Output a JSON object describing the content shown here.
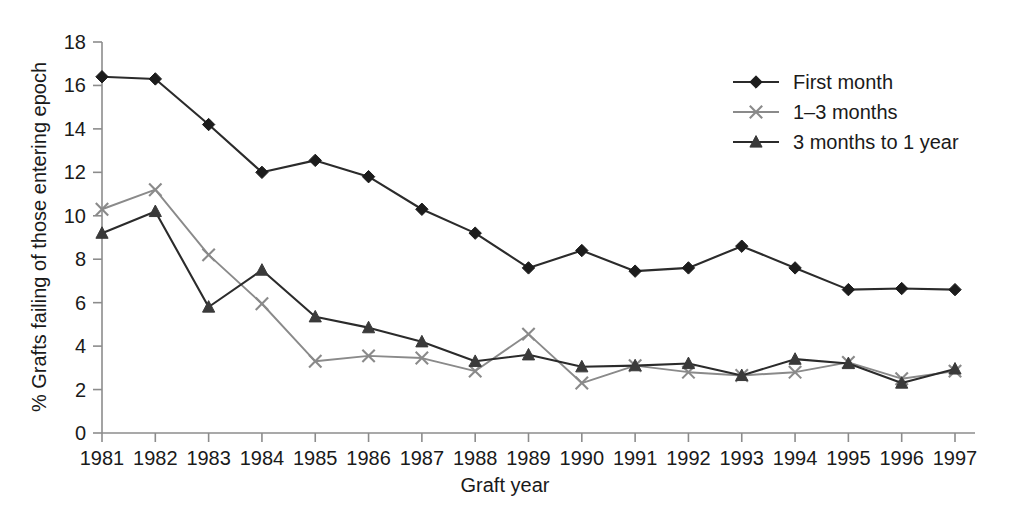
{
  "chart_data": {
    "type": "line",
    "title": "",
    "xlabel": "Graft year",
    "ylabel": "% Grafts failing of those entering epoch",
    "categories": [
      "1981",
      "1982",
      "1983",
      "1984",
      "1985",
      "1986",
      "1987",
      "1988",
      "1989",
      "1990",
      "1991",
      "1992",
      "1993",
      "1994",
      "1995",
      "1996",
      "1997"
    ],
    "x": [
      1981,
      1982,
      1983,
      1984,
      1985,
      1986,
      1987,
      1988,
      1989,
      1990,
      1991,
      1992,
      1993,
      1994,
      1995,
      1996,
      1997
    ],
    "xlim": [
      1981,
      1997
    ],
    "ylim": [
      0,
      18
    ],
    "yticks": [
      0,
      2,
      4,
      6,
      8,
      10,
      12,
      14,
      16,
      18
    ],
    "ytick_labels": [
      "0",
      "2",
      "4",
      "6",
      "8",
      "10",
      "12",
      "14",
      "16",
      "18"
    ],
    "grid": false,
    "legend_position": "top-right",
    "series": [
      {
        "name": "First month",
        "marker": "diamond",
        "color": "#1c1c1c",
        "line_color": "#2b2b2b",
        "values": [
          16.4,
          16.3,
          14.2,
          12.0,
          12.55,
          11.8,
          10.3,
          9.2,
          7.6,
          8.4,
          7.45,
          7.6,
          8.6,
          7.6,
          6.6,
          6.65,
          6.6
        ]
      },
      {
        "name": "1–3 months",
        "marker": "x",
        "color": "#8a8a8a",
        "line_color": "#8a8a8a",
        "values": [
          10.3,
          11.2,
          8.2,
          5.95,
          3.3,
          3.55,
          3.45,
          2.85,
          4.55,
          2.3,
          3.1,
          2.8,
          2.65,
          2.8,
          3.25,
          2.5,
          2.85
        ]
      },
      {
        "name": "3 months to 1 year",
        "marker": "triangle",
        "color": "#3a3a3a",
        "line_color": "#3a3a3a",
        "values": [
          9.2,
          10.2,
          5.8,
          7.5,
          5.35,
          4.85,
          4.2,
          3.3,
          3.6,
          3.05,
          3.1,
          3.2,
          2.65,
          3.4,
          3.2,
          2.3,
          2.95
        ]
      }
    ]
  },
  "legend": {
    "items": [
      {
        "label": "First month",
        "marker": "diamond",
        "color": "#1c1c1c"
      },
      {
        "label": "1–3 months",
        "marker": "x",
        "color": "#8a8a8a"
      },
      {
        "label": "3 months to 1 year",
        "marker": "triangle",
        "color": "#3a3a3a"
      }
    ]
  },
  "axes": {
    "x_title": "Graft year",
    "y_title": "% Grafts failing of those entering epoch"
  }
}
